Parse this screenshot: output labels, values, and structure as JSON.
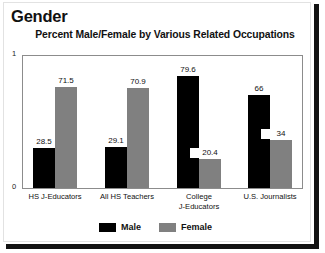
{
  "chart_data": {
    "type": "bar",
    "title": "Gender",
    "subtitle": "Percent  Male/Female by Various Related Occupations",
    "xlabel": "",
    "ylabel": "",
    "ylim": [
      0,
      1
    ],
    "ytick_labels": [
      "0",
      "1"
    ],
    "grid": false,
    "legend_position": "bottom-center",
    "categories": [
      "HS J-Educators",
      "All HS Teachers",
      "College J-Educators",
      "U.S. Journalists"
    ],
    "category_lines": [
      [
        "HS J-Educators"
      ],
      [
        "All HS Teachers"
      ],
      [
        "College",
        "J-Educators"
      ],
      [
        "U.S. Journalists"
      ]
    ],
    "series": [
      {
        "name": "Male",
        "color": "#000000",
        "values": [
          28.5,
          29.1,
          79.6,
          66
        ],
        "labels": [
          "28.5",
          "29.1",
          "79.6",
          "66"
        ]
      },
      {
        "name": "Female",
        "color": "#808080",
        "values": [
          71.5,
          70.9,
          20.4,
          34
        ],
        "labels": [
          "71.5",
          "70.9",
          "20.4",
          "34"
        ]
      }
    ]
  },
  "legend": {
    "items": [
      {
        "label": "Male",
        "color": "#000000"
      },
      {
        "label": "Female",
        "color": "#808080"
      }
    ]
  }
}
